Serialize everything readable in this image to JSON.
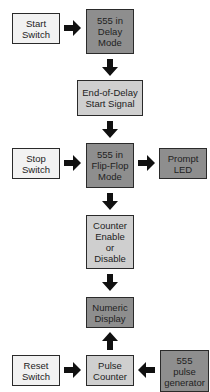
{
  "diagram": {
    "nodes": [
      {
        "id": "start_switch",
        "label": "Start\nSwitch",
        "shade": "#f2f2f2"
      },
      {
        "id": "delay_555",
        "label": "555 in\nDelay\nMode",
        "shade": "#8e8e8e"
      },
      {
        "id": "end_of_delay",
        "label": "End-of-Delay\nStart Signal",
        "shade": "#cfcfcf"
      },
      {
        "id": "stop_switch",
        "label": "Stop\nSwitch",
        "shade": "#f2f2f2"
      },
      {
        "id": "flipflop_555",
        "label": "555 in\nFlip-Flop\nMode",
        "shade": "#8e8e8e"
      },
      {
        "id": "prompt_led",
        "label": "Prompt\nLED",
        "shade": "#8e8e8e"
      },
      {
        "id": "counter_enable",
        "label": "Counter\nEnable\nor\nDisable",
        "shade": "#cfcfcf"
      },
      {
        "id": "numeric_display",
        "label": "Numeric\nDisplay",
        "shade": "#8e8e8e"
      },
      {
        "id": "reset_switch",
        "label": "Reset\nSwitch",
        "shade": "#f2f2f2"
      },
      {
        "id": "pulse_counter",
        "label": "Pulse\nCounter",
        "shade": "#cfcfcf"
      },
      {
        "id": "pulse_generator_555",
        "label": "555\npulse\ngenerator",
        "shade": "#8e8e8e"
      }
    ],
    "edges": [
      {
        "from": "start_switch",
        "to": "delay_555"
      },
      {
        "from": "delay_555",
        "to": "end_of_delay"
      },
      {
        "from": "end_of_delay",
        "to": "flipflop_555"
      },
      {
        "from": "stop_switch",
        "to": "flipflop_555"
      },
      {
        "from": "flipflop_555",
        "to": "prompt_led"
      },
      {
        "from": "flipflop_555",
        "to": "counter_enable"
      },
      {
        "from": "counter_enable",
        "to": "numeric_display"
      },
      {
        "from": "pulse_counter",
        "to": "numeric_display"
      },
      {
        "from": "reset_switch",
        "to": "pulse_counter"
      },
      {
        "from": "pulse_generator_555",
        "to": "pulse_counter"
      }
    ]
  }
}
